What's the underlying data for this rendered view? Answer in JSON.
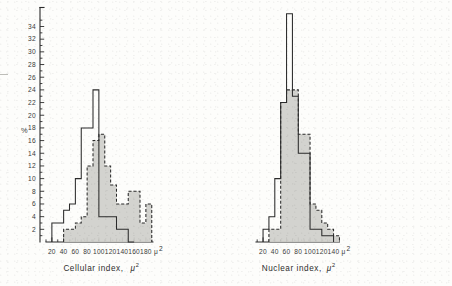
{
  "figure": {
    "y_axis": {
      "label": "%",
      "ticks": [
        2,
        4,
        6,
        8,
        10,
        12,
        14,
        16,
        18,
        20,
        22,
        24,
        26,
        28,
        30,
        32,
        34
      ],
      "min": 0,
      "max": 37,
      "minor_tick_step": 1
    },
    "panels": [
      {
        "name": "cellular-index",
        "axis_title": "Cellular index,",
        "axis_unit_symbol": "μ",
        "axis_unit_exponent": "2",
        "x_ticks": [
          20,
          40,
          60,
          80,
          100,
          120,
          140,
          160,
          180
        ],
        "x_min": 10,
        "x_max": 192,
        "minor_tick_step": 10
      },
      {
        "name": "nuclear-index",
        "axis_title": "Nuclear index,",
        "axis_unit_symbol": "μ",
        "axis_unit_exponent": "2",
        "x_ticks": [
          20,
          40,
          60,
          80,
          100,
          120,
          140
        ],
        "x_min": 8,
        "x_max": 150,
        "minor_tick_step": 10
      }
    ]
  },
  "chart_data": {
    "type": "bar",
    "title": "",
    "ylabel": "%",
    "ylim": [
      0,
      37
    ],
    "grid": false,
    "legend": "none",
    "panels": [
      {
        "name": "Cellular index",
        "xlabel": "Cellular index, μ2",
        "xlim": [
          10,
          192
        ],
        "bin_width": 10,
        "series": [
          {
            "name": "solid-outline-group",
            "style": "solid-open",
            "bin_starts": [
              20,
              30,
              40,
              50,
              60,
              70,
              80,
              90,
              100,
              110,
              120,
              130,
              140,
              150
            ],
            "values": [
              3,
              3,
              5,
              6,
              10,
              18,
              18,
              24,
              4,
              4,
              4,
              2,
              2,
              0
            ]
          },
          {
            "name": "dashed-shaded-group",
            "style": "dashed-shaded",
            "bin_starts": [
              40,
              50,
              60,
              70,
              80,
              90,
              100,
              110,
              120,
              130,
              140,
              150,
              160,
              170,
              180
            ],
            "values": [
              2,
              2,
              3,
              4,
              12,
              16,
              17,
              12,
              9,
              6,
              6,
              8,
              8,
              3,
              6
            ]
          }
        ]
      },
      {
        "name": "Nuclear index",
        "xlabel": "Nuclear index, μ2",
        "xlim": [
          8,
          150
        ],
        "bin_width": 10,
        "series": [
          {
            "name": "solid-outline-group",
            "style": "solid-open",
            "bin_starts": [
              20,
              30,
              40,
              50,
              60,
              70,
              80,
              90,
              100,
              110,
              120,
              130
            ],
            "values": [
              2,
              4,
              10,
              22,
              36,
              23,
              14,
              14,
              2,
              2,
              1,
              1
            ]
          },
          {
            "name": "dashed-shaded-group",
            "style": "dashed-shaded",
            "bin_starts": [
              30,
              40,
              50,
              60,
              70,
              80,
              90,
              100,
              110,
              120,
              130,
              140
            ],
            "values": [
              2,
              2,
              22,
              24,
              24,
              17,
              17,
              6,
              5,
              3,
              2,
              1
            ]
          }
        ]
      }
    ]
  }
}
